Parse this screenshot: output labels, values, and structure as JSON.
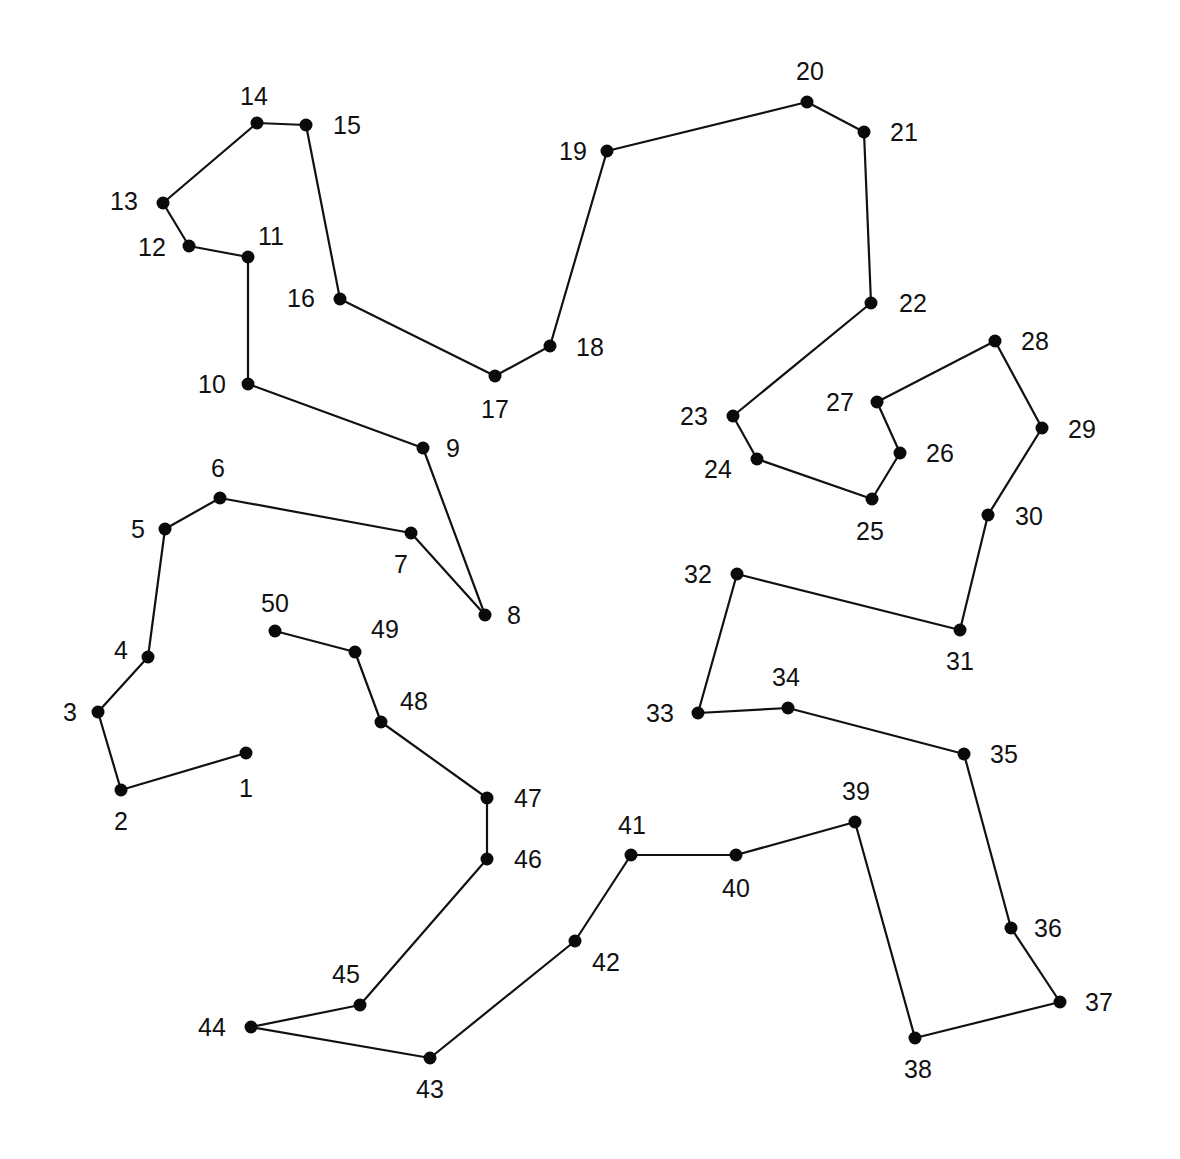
{
  "puzzle": {
    "type": "connect-the-dots",
    "style": {
      "background": "#ffffff",
      "line_color": "#111111",
      "dot_color": "#0a0a0a",
      "label_color": "#111111",
      "dot_radius": 6.5,
      "font_size": 25
    },
    "closed": false,
    "points": [
      {
        "n": "1",
        "x": 246,
        "y": 753,
        "lx": 246,
        "ly": 797,
        "anchor": "middle"
      },
      {
        "n": "2",
        "x": 121,
        "y": 790,
        "lx": 121,
        "ly": 830,
        "anchor": "middle"
      },
      {
        "n": "3",
        "x": 98,
        "y": 712,
        "lx": 70,
        "ly": 721,
        "anchor": "middle"
      },
      {
        "n": "4",
        "x": 148,
        "y": 657,
        "lx": 121,
        "ly": 659,
        "anchor": "middle"
      },
      {
        "n": "5",
        "x": 165,
        "y": 529,
        "lx": 138,
        "ly": 538,
        "anchor": "middle"
      },
      {
        "n": "6",
        "x": 220,
        "y": 498,
        "lx": 218,
        "ly": 477,
        "anchor": "middle"
      },
      {
        "n": "7",
        "x": 411,
        "y": 533,
        "lx": 401,
        "ly": 573,
        "anchor": "middle"
      },
      {
        "n": "8",
        "x": 485,
        "y": 615,
        "lx": 514,
        "ly": 624,
        "anchor": "middle"
      },
      {
        "n": "9",
        "x": 423,
        "y": 448,
        "lx": 453,
        "ly": 457,
        "anchor": "middle"
      },
      {
        "n": "10",
        "x": 248,
        "y": 384,
        "lx": 212,
        "ly": 393,
        "anchor": "middle"
      },
      {
        "n": "11",
        "x": 248,
        "y": 257,
        "lx": 271,
        "ly": 245,
        "anchor": "middle"
      },
      {
        "n": "12",
        "x": 189,
        "y": 246,
        "lx": 152,
        "ly": 256,
        "anchor": "middle"
      },
      {
        "n": "13",
        "x": 163,
        "y": 203,
        "lx": 124,
        "ly": 210,
        "anchor": "middle"
      },
      {
        "n": "14",
        "x": 257,
        "y": 123,
        "lx": 254,
        "ly": 105,
        "anchor": "middle"
      },
      {
        "n": "15",
        "x": 306,
        "y": 125,
        "lx": 347,
        "ly": 134,
        "anchor": "middle"
      },
      {
        "n": "16",
        "x": 340,
        "y": 299,
        "lx": 301,
        "ly": 307,
        "anchor": "middle"
      },
      {
        "n": "17",
        "x": 495,
        "y": 376,
        "lx": 495,
        "ly": 418,
        "anchor": "middle"
      },
      {
        "n": "18",
        "x": 550,
        "y": 346,
        "lx": 590,
        "ly": 356,
        "anchor": "middle"
      },
      {
        "n": "19",
        "x": 607,
        "y": 151,
        "lx": 573,
        "ly": 160,
        "anchor": "middle"
      },
      {
        "n": "20",
        "x": 807,
        "y": 102,
        "lx": 810,
        "ly": 80,
        "anchor": "middle"
      },
      {
        "n": "21",
        "x": 864,
        "y": 132,
        "lx": 904,
        "ly": 141,
        "anchor": "middle"
      },
      {
        "n": "22",
        "x": 871,
        "y": 303,
        "lx": 913,
        "ly": 312,
        "anchor": "middle"
      },
      {
        "n": "23",
        "x": 733,
        "y": 416,
        "lx": 694,
        "ly": 425,
        "anchor": "middle"
      },
      {
        "n": "24",
        "x": 757,
        "y": 459,
        "lx": 718,
        "ly": 478,
        "anchor": "middle"
      },
      {
        "n": "25",
        "x": 872,
        "y": 499,
        "lx": 870,
        "ly": 540,
        "anchor": "middle"
      },
      {
        "n": "26",
        "x": 900,
        "y": 453,
        "lx": 940,
        "ly": 462,
        "anchor": "middle"
      },
      {
        "n": "27",
        "x": 877,
        "y": 402,
        "lx": 840,
        "ly": 411,
        "anchor": "middle"
      },
      {
        "n": "28",
        "x": 995,
        "y": 341,
        "lx": 1035,
        "ly": 350,
        "anchor": "middle"
      },
      {
        "n": "29",
        "x": 1042,
        "y": 428,
        "lx": 1082,
        "ly": 438,
        "anchor": "middle"
      },
      {
        "n": "30",
        "x": 988,
        "y": 515,
        "lx": 1029,
        "ly": 525,
        "anchor": "middle"
      },
      {
        "n": "31",
        "x": 960,
        "y": 630,
        "lx": 960,
        "ly": 670,
        "anchor": "middle"
      },
      {
        "n": "32",
        "x": 737,
        "y": 574,
        "lx": 698,
        "ly": 583,
        "anchor": "middle"
      },
      {
        "n": "33",
        "x": 698,
        "y": 713,
        "lx": 660,
        "ly": 722,
        "anchor": "middle"
      },
      {
        "n": "34",
        "x": 788,
        "y": 708,
        "lx": 786,
        "ly": 686,
        "anchor": "middle"
      },
      {
        "n": "35",
        "x": 964,
        "y": 754,
        "lx": 1004,
        "ly": 763,
        "anchor": "middle"
      },
      {
        "n": "36",
        "x": 1011,
        "y": 928,
        "lx": 1048,
        "ly": 937,
        "anchor": "middle"
      },
      {
        "n": "37",
        "x": 1060,
        "y": 1002,
        "lx": 1099,
        "ly": 1011,
        "anchor": "middle"
      },
      {
        "n": "38",
        "x": 915,
        "y": 1038,
        "lx": 918,
        "ly": 1078,
        "anchor": "middle"
      },
      {
        "n": "39",
        "x": 855,
        "y": 822,
        "lx": 856,
        "ly": 800,
        "anchor": "middle"
      },
      {
        "n": "40",
        "x": 736,
        "y": 855,
        "lx": 736,
        "ly": 897,
        "anchor": "middle"
      },
      {
        "n": "41",
        "x": 631,
        "y": 855,
        "lx": 632,
        "ly": 834,
        "anchor": "middle"
      },
      {
        "n": "42",
        "x": 575,
        "y": 941,
        "lx": 606,
        "ly": 971,
        "anchor": "middle"
      },
      {
        "n": "43",
        "x": 430,
        "y": 1058,
        "lx": 430,
        "ly": 1098,
        "anchor": "middle"
      },
      {
        "n": "44",
        "x": 251,
        "y": 1027,
        "lx": 212,
        "ly": 1036,
        "anchor": "middle"
      },
      {
        "n": "45",
        "x": 360,
        "y": 1005,
        "lx": 346,
        "ly": 983,
        "anchor": "middle"
      },
      {
        "n": "46",
        "x": 487,
        "y": 859,
        "lx": 528,
        "ly": 868,
        "anchor": "middle"
      },
      {
        "n": "47",
        "x": 487,
        "y": 798,
        "lx": 528,
        "ly": 807,
        "anchor": "middle"
      },
      {
        "n": "48",
        "x": 381,
        "y": 722,
        "lx": 414,
        "ly": 710,
        "anchor": "middle"
      },
      {
        "n": "49",
        "x": 355,
        "y": 652,
        "lx": 385,
        "ly": 638,
        "anchor": "middle"
      },
      {
        "n": "50",
        "x": 275,
        "y": 631,
        "lx": 275,
        "ly": 612,
        "anchor": "middle"
      }
    ]
  }
}
